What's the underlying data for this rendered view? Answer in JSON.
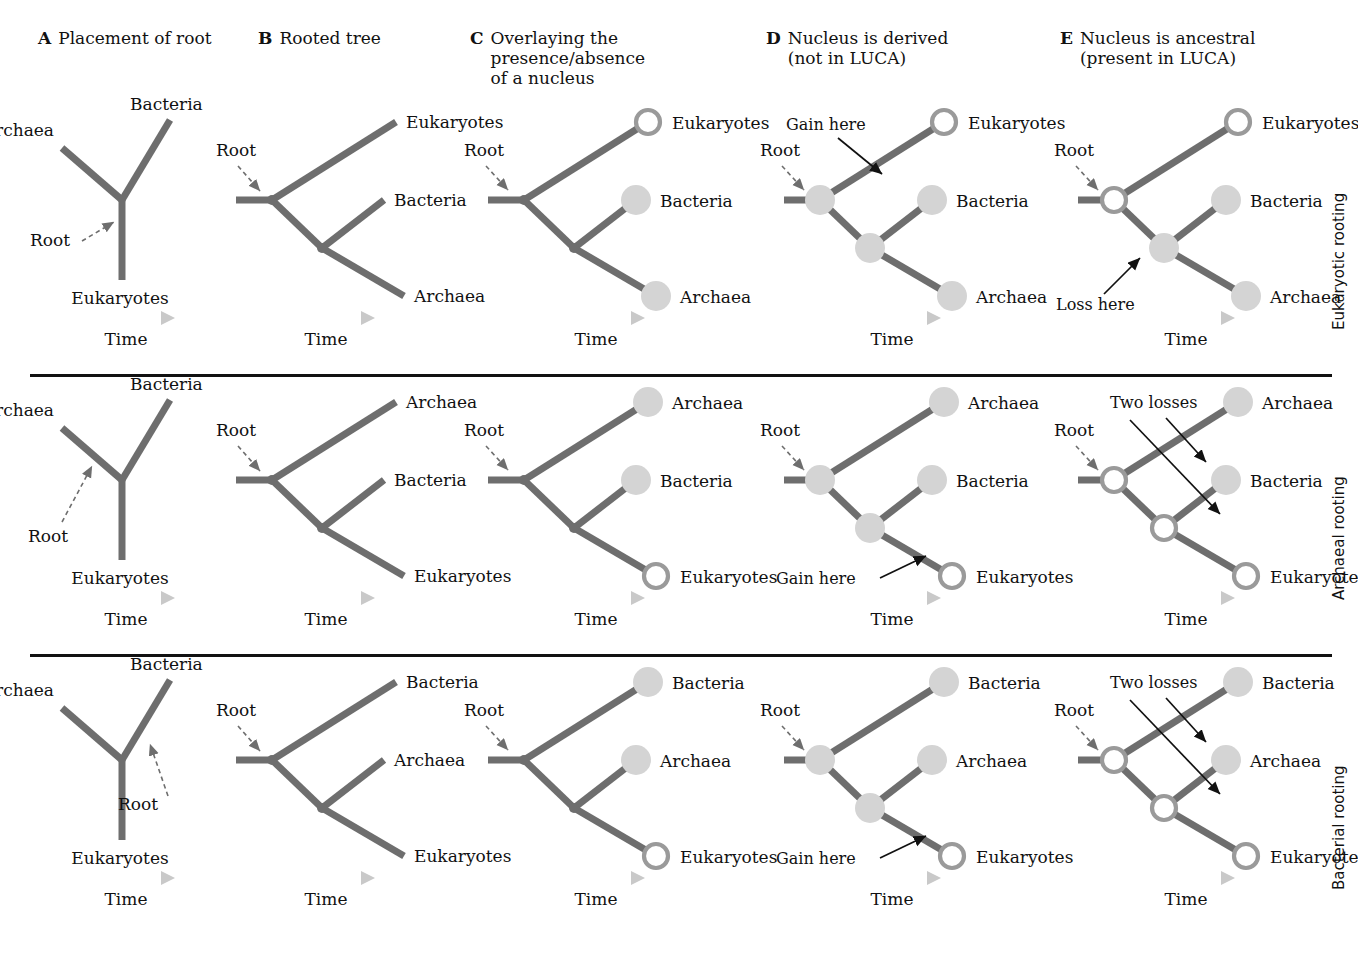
{
  "figure": {
    "title_panels": [
      {
        "letter": "A",
        "title": "Placement of root",
        "x": 38,
        "y": 28
      },
      {
        "letter": "B",
        "title": "Rooted tree",
        "x": 258,
        "y": 28
      },
      {
        "letter": "C",
        "title": "Overlaying the\npresence/absence\nof a nucleus",
        "x": 470,
        "y": 28
      },
      {
        "letter": "D",
        "title": "Nucleus is derived\n(not in LUCA)",
        "x": 766,
        "y": 28
      },
      {
        "letter": "E",
        "title": "Nucleus is ancestral\n(present in LUCA)",
        "x": 1060,
        "y": 28
      }
    ],
    "row_labels": [
      "Eukaryotic rooting",
      "Archaeal rooting",
      "Bacterial rooting"
    ],
    "dividers_y": [
      374,
      654
    ],
    "time_label": "Time",
    "root_label": "Root",
    "gain_label": "Gain here",
    "loss_label": "Loss here",
    "two_losses_label": "Two losses",
    "colors": {
      "branch": "#6e6e6e",
      "node_fill": "#d4d4d4",
      "node_ring": "#9a9a9a",
      "text": "#111111",
      "divider": "#111111",
      "time_arrow": "#c9c9c9",
      "dashed_arrow": "#6e6e6e",
      "solid_arrow": "#111111"
    },
    "taxa": [
      "Eukaryotes",
      "Bacteria",
      "Archaea"
    ],
    "rows": [
      {
        "id": "eukaryotic-rooting",
        "label": "Eukaryotic rooting",
        "unrooted_root_branch": "Eukaryotes",
        "tip_order": [
          "Eukaryotes",
          "Bacteria",
          "Archaea"
        ],
        "nucleus_tips": [
          "Eukaryotes"
        ],
        "derived_event": {
          "type": "gain",
          "label": "Gain here",
          "on_branch": "Eukaryotes"
        },
        "ancestral_events": [
          {
            "type": "loss",
            "label": "Loss here",
            "on_branch": "internal"
          }
        ],
        "ancestral_label": "Loss here",
        "ancestral_nodes_with_nucleus": [
          "root"
        ]
      },
      {
        "id": "archaeal-rooting",
        "label": "Archaeal rooting",
        "unrooted_root_branch": "Archaea",
        "tip_order": [
          "Archaea",
          "Bacteria",
          "Eukaryotes"
        ],
        "nucleus_tips": [
          "Eukaryotes"
        ],
        "derived_event": {
          "type": "gain",
          "label": "Gain here",
          "on_branch": "Eukaryotes"
        },
        "ancestral_events": [
          {
            "type": "loss",
            "label": "Two losses",
            "on_branch": "Archaea"
          },
          {
            "type": "loss",
            "label": "Two losses",
            "on_branch": "Bacteria"
          }
        ],
        "ancestral_label": "Two losses",
        "ancestral_nodes_with_nucleus": [
          "root",
          "inner"
        ]
      },
      {
        "id": "bacterial-rooting",
        "label": "Bacterial rooting",
        "unrooted_root_branch": "Bacteria",
        "tip_order": [
          "Bacteria",
          "Archaea",
          "Eukaryotes"
        ],
        "nucleus_tips": [
          "Eukaryotes"
        ],
        "derived_event": {
          "type": "gain",
          "label": "Gain here",
          "on_branch": "Eukaryotes"
        },
        "ancestral_events": [
          {
            "type": "loss",
            "label": "Two losses",
            "on_branch": "Bacteria"
          },
          {
            "type": "loss",
            "label": "Two losses",
            "on_branch": "Archaea"
          }
        ],
        "ancestral_label": "Two losses",
        "ancestral_nodes_with_nucleus": [
          "root",
          "inner"
        ]
      }
    ],
    "unrooted_labels": {
      "top_left": "Archaea",
      "top_right": "Bacteria",
      "bottom": "Eukaryotes"
    }
  }
}
